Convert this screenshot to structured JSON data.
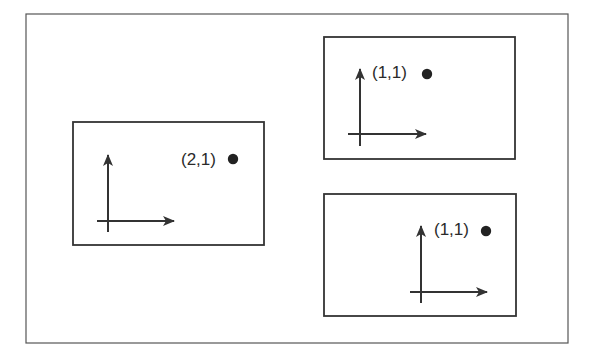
{
  "diagram": {
    "type": "coordinate-frames",
    "frame": {
      "x": 26,
      "y": 14,
      "width": 542,
      "height": 329,
      "stroke": "#555555"
    },
    "panels": [
      {
        "id": "left",
        "box": {
          "x": 73,
          "y": 122,
          "width": 191,
          "height": 123
        },
        "axes": {
          "origin_x": 108,
          "origin_y": 221,
          "x_start": 97,
          "x_end": 174,
          "y_start": 232,
          "y_end": 155
        },
        "point": {
          "label": "(2,1)",
          "label_x": 181,
          "label_y": 165,
          "dot_x": 233,
          "dot_y": 159
        }
      },
      {
        "id": "top-right",
        "box": {
          "x": 324,
          "y": 37,
          "width": 191,
          "height": 122
        },
        "axes": {
          "origin_x": 360,
          "origin_y": 134,
          "x_start": 348,
          "x_end": 426,
          "y_start": 146,
          "y_end": 69
        },
        "point": {
          "label": "(1,1)",
          "label_x": 372,
          "label_y": 78,
          "dot_x": 427,
          "dot_y": 74
        }
      },
      {
        "id": "bottom-right",
        "box": {
          "x": 324,
          "y": 194,
          "width": 192,
          "height": 122
        },
        "axes": {
          "origin_x": 421,
          "origin_y": 292,
          "x_start": 410,
          "x_end": 487,
          "y_start": 303,
          "y_end": 226
        },
        "point": {
          "label": "(1,1)",
          "label_x": 434,
          "label_y": 235,
          "dot_x": 486,
          "dot_y": 231
        }
      }
    ],
    "colors": {
      "stroke": "#333333",
      "frame": "#555555",
      "dot": "#222222",
      "background": "#ffffff"
    }
  }
}
